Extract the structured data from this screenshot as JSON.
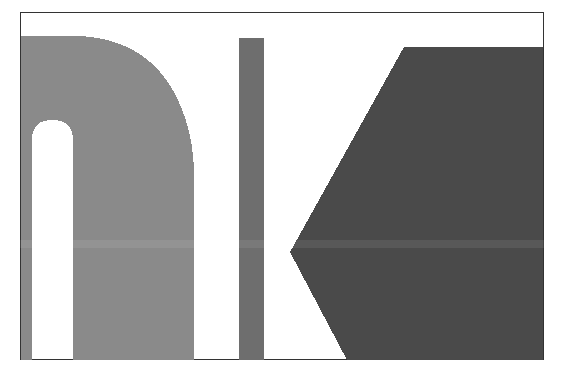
{
  "image": {
    "description": "Magnified pixelated glyph fragments inside a bordered frame",
    "frame": {
      "x": 20,
      "y": 12,
      "width": 524,
      "height": 348,
      "border_color": "#333333"
    },
    "colors": {
      "background": "#ffffff",
      "arch_fill": "#8a8a8a",
      "bar_fill": "#6e6e6e",
      "wedge_fill": "#4a4a4a",
      "cutout_fill": "#ffffff"
    },
    "shapes": [
      {
        "name": "arch-shape",
        "fill_key": "arch_fill"
      },
      {
        "name": "arch-cutout",
        "fill_key": "cutout_fill"
      },
      {
        "name": "vertical-bar",
        "fill_key": "bar_fill"
      },
      {
        "name": "wedge-shape",
        "fill_key": "wedge_fill"
      }
    ]
  }
}
